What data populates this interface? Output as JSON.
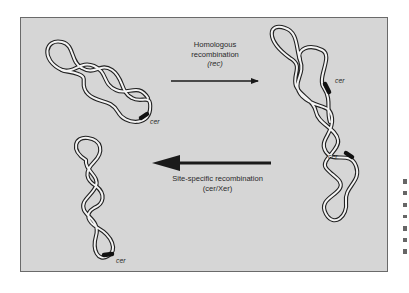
{
  "figure": {
    "background_color": "#d6d6d6",
    "frame_border_color": "#6a6a6a",
    "ink_color": "#2a2a2a"
  },
  "arrows": {
    "forward": {
      "line1": "Homologous",
      "line2": "recombination",
      "line3": "(rec)",
      "direction": "right"
    },
    "reverse": {
      "line1": "Site-specific recombination",
      "line2": "(cer/Xer)",
      "direction": "left"
    }
  },
  "molecules": {
    "monomer_top": {
      "site_label": "cer"
    },
    "dimer": {
      "site_label_1": "cer",
      "site_label_2": "cer"
    },
    "monomer_bottom": {
      "site_label": "cer"
    }
  }
}
